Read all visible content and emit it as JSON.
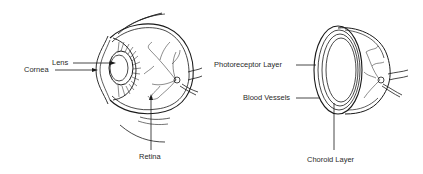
{
  "diagram": {
    "left_figure": {
      "name": "eye-cross-section",
      "labels": {
        "lens": "Lens",
        "cornea": "Cornea",
        "retina": "Retina"
      }
    },
    "right_figure": {
      "name": "retina-layers",
      "labels": {
        "photoreceptor_layer": "Photoreceptor Layer",
        "blood_vessels": "Blood Vessels",
        "choroid_layer": "Choroid Layer"
      }
    },
    "colors": {
      "line": "#1a1a1a",
      "text": "#2a2a2a",
      "background": "#ffffff"
    }
  }
}
